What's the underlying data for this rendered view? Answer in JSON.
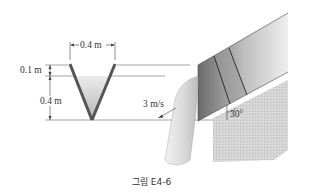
{
  "figure": {
    "caption": "그림 E4-6",
    "labels": {
      "top_width": "0.4 m",
      "freeboard": "0.1 m",
      "water_depth": "0.4 m",
      "velocity": "3 m/s",
      "angle": "30°"
    },
    "colors": {
      "channel_wall": "#555555",
      "water_fill": "#c8c8c8",
      "ground": "#d6d6d6",
      "lines": "#444444"
    }
  }
}
